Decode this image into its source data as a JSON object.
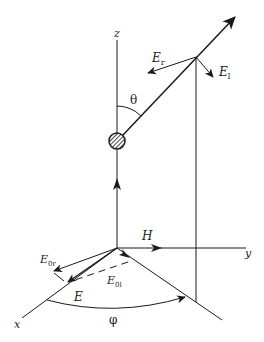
{
  "diagram": {
    "type": "scattering-geometry",
    "stroke_color": "#1a1a1a",
    "background": "#ffffff",
    "axes": {
      "z": "z",
      "y": "y",
      "x": "x"
    },
    "labels": {
      "E_r": {
        "base": "E",
        "sub": "r"
      },
      "E_l": {
        "base": "E",
        "sub": "l"
      },
      "theta": "θ",
      "H": "H",
      "E_0r": {
        "base": "E",
        "sub": "0r"
      },
      "E_0l": {
        "base": "E",
        "sub": "0l"
      },
      "E": "E",
      "phi": "φ"
    },
    "elements": [
      "z-axis",
      "y-axis",
      "x-axis",
      "scattering-particle",
      "scattered-ray",
      "incident-direction-arrow",
      "polar-angle-arc",
      "azimuth-angle-arc",
      "projection-lines"
    ]
  }
}
